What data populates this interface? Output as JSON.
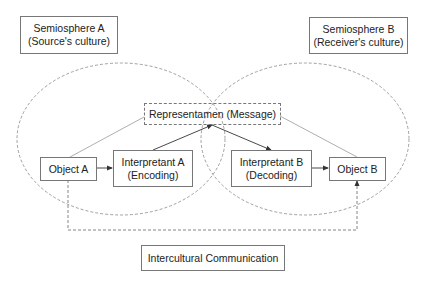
{
  "diagram": {
    "semiospheres": [
      {
        "id": "A",
        "line1": "Semiosphere A",
        "line2": "(Source's culture)"
      },
      {
        "id": "B",
        "line1": "Semiosphere B",
        "line2": "(Receiver's culture)"
      }
    ],
    "nodes": {
      "representamen": {
        "label": "Representamen (Message)"
      },
      "object_a": {
        "label": "Object A"
      },
      "interpretant_a": {
        "line1": "Interpretant A",
        "line2": "(Encoding)"
      },
      "interpretant_b": {
        "line1": "Interpretant B",
        "line2": "(Decoding)"
      },
      "object_b": {
        "label": "Object B"
      }
    },
    "footer": {
      "label": "Intercultural Communication"
    },
    "edges": [
      {
        "from": "Object A",
        "to": "Interpretant A",
        "style": "solid-arrow"
      },
      {
        "from": "Interpretant A",
        "to": "Representamen (Message)",
        "style": "solid-arrow"
      },
      {
        "from": "Representamen (Message)",
        "to": "Interpretant B",
        "style": "solid-arrow"
      },
      {
        "from": "Interpretant B",
        "to": "Object B",
        "style": "solid-arrow"
      },
      {
        "from": "Object A",
        "to": "Representamen (Message)",
        "style": "thin-line"
      },
      {
        "from": "Representamen (Message)",
        "to": "Object B",
        "style": "thin-line"
      },
      {
        "from": "Object A",
        "to": "Object B",
        "style": "dashed-arrow",
        "label_ref": "Intercultural Communication"
      }
    ],
    "colors": {
      "line": "#777777",
      "arrow": "#333333",
      "text": "#222222",
      "background": "#ffffff"
    }
  }
}
